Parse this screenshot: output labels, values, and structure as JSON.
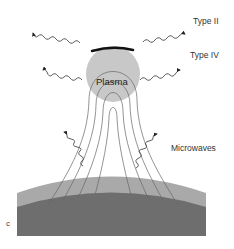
{
  "figure": {
    "panel_label": "c",
    "labels": {
      "type_ii": "Type II",
      "type_iv": "Type IV",
      "plasma": "Plasma",
      "microwaves": "Microwaves"
    },
    "colors": {
      "plasma_fill": "#c8c8c8",
      "shock_bar": "#111111",
      "atmosphere_light": "#a9a9a9",
      "surface_dark": "#6e6e6e",
      "field_lines": "#666666",
      "waves": "#333333"
    }
  }
}
